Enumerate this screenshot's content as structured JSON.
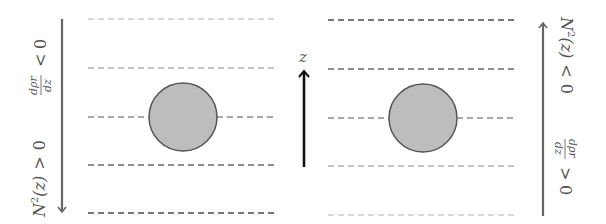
{
  "diagram": {
    "left_panel": {
      "label_stability": "N²(z) > 0",
      "label_stability_parts": {
        "var": "N",
        "sup": "2",
        "arg": "(z)",
        "rel": ">",
        "val": "0"
      },
      "label_gradient": "dρr/dz < 0",
      "label_gradient_parts": {
        "num": "dρr",
        "den": "dz",
        "rel": "<",
        "val": "0"
      },
      "arrow_direction": "down",
      "arrow_color": "#666666",
      "dashed_lines": [
        {
          "y": 19,
          "color": "#d9d9d9"
        },
        {
          "y": 68,
          "color": "#c4c4c4"
        },
        {
          "y": 117,
          "color": "#a8a8a8"
        },
        {
          "y": 165,
          "color": "#8c8c8c"
        },
        {
          "y": 213,
          "color": "#777777"
        }
      ],
      "particle": {
        "cx": 183,
        "cy": 117,
        "r": 34,
        "fill": "#bdbdbd",
        "stroke": "#555555"
      }
    },
    "axis": {
      "label": "z",
      "arrow_direction": "up",
      "arrow_color": "#111111"
    },
    "right_panel": {
      "label_stability": "N²(z) < 0",
      "label_stability_parts": {
        "var": "N",
        "sup": "2",
        "arg": "(z)",
        "rel": "<",
        "val": "0"
      },
      "label_gradient": "dρr/dz > 0",
      "label_gradient_parts": {
        "num": "dρr",
        "den": "dz",
        "rel": ">",
        "val": "0"
      },
      "arrow_direction": "up",
      "arrow_color": "#666666",
      "dashed_lines": [
        {
          "y": 20,
          "color": "#777777"
        },
        {
          "y": 69,
          "color": "#8c8c8c"
        },
        {
          "y": 118,
          "color": "#a8a8a8"
        },
        {
          "y": 166,
          "color": "#c4c4c4"
        },
        {
          "y": 215,
          "color": "#d9d9d9"
        }
      ],
      "particle": {
        "cx": 423,
        "cy": 118,
        "r": 34,
        "fill": "#bdbdbd",
        "stroke": "#555555"
      }
    }
  }
}
